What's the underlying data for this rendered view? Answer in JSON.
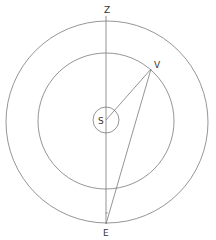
{
  "diagram": {
    "colors": {
      "stroke": "#7a7a7a",
      "text": "#333333",
      "background": "#ffffff"
    },
    "circles": [
      {
        "name": "outer-orbit",
        "cx": 107,
        "cy": 122,
        "r": 101
      },
      {
        "name": "inner-orbit",
        "cx": 106,
        "cy": 121,
        "r": 68
      },
      {
        "name": "sun-circle",
        "cx": 106,
        "cy": 120,
        "r": 13
      }
    ],
    "points": {
      "S": {
        "x": 106,
        "y": 120
      },
      "V": {
        "x": 151,
        "y": 69
      },
      "E": {
        "x": 106,
        "y": 224
      },
      "Z": {
        "x": 106,
        "y": 16
      }
    },
    "labels": {
      "Z": "Z",
      "V": "V",
      "S": "S",
      "E": "E"
    },
    "segments": [
      {
        "name": "axis-z-e",
        "from": "Z",
        "to": "E"
      },
      {
        "name": "segment-s-v",
        "from": "S",
        "to": "V"
      },
      {
        "name": "segment-v-e",
        "from": "V",
        "to": "E"
      }
    ]
  }
}
